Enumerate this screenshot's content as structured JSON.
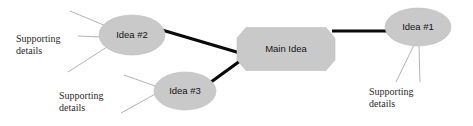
{
  "diagram": {
    "type": "concept-map",
    "canvas": {
      "width": 473,
      "height": 126,
      "background": "#ffffff"
    },
    "colors": {
      "node_fill": "#c9c9c9",
      "node_stroke": "#bdbdbd",
      "main_link": "#0a0a0a",
      "detail_link": "#9a9a9a",
      "node_text": "#141414",
      "detail_text": "#2a2a2a"
    },
    "nodes": [
      {
        "id": "main-idea",
        "label": "Main Idea",
        "shape": "octagon",
        "cx": 286,
        "cy": 49,
        "rx": 49,
        "ry": 21.5
      },
      {
        "id": "idea-1",
        "label": "Idea #1",
        "shape": "ellipse",
        "cx": 418,
        "cy": 27,
        "rx": 33,
        "ry": 19
      },
      {
        "id": "idea-2",
        "label": "Idea #2",
        "shape": "ellipse",
        "cx": 132,
        "cy": 35,
        "rx": 33,
        "ry": 20
      },
      {
        "id": "idea-3",
        "label": "Idea #3",
        "shape": "ellipse",
        "cx": 185,
        "cy": 91,
        "rx": 31,
        "ry": 19
      }
    ],
    "main_links": [
      {
        "id": "link-idea2-main",
        "from": "idea-2",
        "to": "main-idea",
        "x1": 162,
        "y1": 30,
        "x2": 240,
        "y2": 53
      },
      {
        "id": "link-idea3-main",
        "from": "idea-3",
        "to": "main-idea",
        "x1": 211,
        "y1": 82,
        "x2": 240,
        "y2": 61
      },
      {
        "id": "link-main-idea1",
        "from": "main-idea",
        "to": "idea-1",
        "x1": 332,
        "y1": 31,
        "x2": 390,
        "y2": 31
      }
    ],
    "detail_labels": [
      {
        "id": "details-idea-2",
        "line1": "Supporting",
        "line2": "details",
        "x": 16,
        "y": 34,
        "attached_to": "idea-2"
      },
      {
        "id": "details-idea-3",
        "line1": "Supporting",
        "line2": "details",
        "x": 59,
        "y": 91,
        "attached_to": "idea-3"
      },
      {
        "id": "details-idea-1",
        "line1": "Supporting",
        "line2": "details",
        "x": 369,
        "y": 87,
        "attached_to": "idea-1"
      }
    ],
    "detail_links": [
      {
        "id": "detail-link-i2-a",
        "x1": 70,
        "y1": 11,
        "x2": 106,
        "y2": 26
      },
      {
        "id": "detail-link-i2-b",
        "x1": 78,
        "y1": 36,
        "x2": 101,
        "y2": 37
      },
      {
        "id": "detail-link-i2-c",
        "x1": 68,
        "y1": 72,
        "x2": 107,
        "y2": 47
      },
      {
        "id": "detail-link-i3-a",
        "x1": 124,
        "y1": 75,
        "x2": 158,
        "y2": 87
      },
      {
        "id": "detail-link-i3-b",
        "x1": 121,
        "y1": 113,
        "x2": 159,
        "y2": 92
      },
      {
        "id": "detail-link-i1-a",
        "x1": 396,
        "y1": 82,
        "x2": 414,
        "y2": 45
      },
      {
        "id": "detail-link-i1-b",
        "x1": 420,
        "y1": 82,
        "x2": 419,
        "y2": 46
      }
    ]
  }
}
